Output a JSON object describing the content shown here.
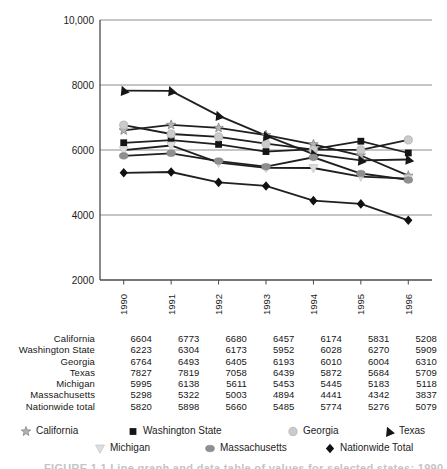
{
  "chart_data": {
    "type": "line",
    "categories": [
      "1990",
      "1991",
      "1992",
      "1993",
      "1994",
      "1995",
      "1996"
    ],
    "ylim": [
      2000,
      10000
    ],
    "yticks": [
      {
        "value": 10000,
        "label": "10,000"
      },
      {
        "value": 8000,
        "label": "8000"
      },
      {
        "value": 6000,
        "label": "6000"
      },
      {
        "value": 4000,
        "label": "4000"
      },
      {
        "value": 2000,
        "label": "2000"
      }
    ],
    "grid": true,
    "line_color": "#1f1f1f",
    "series": [
      {
        "name": "California",
        "marker": "star",
        "values": [
          6604,
          6773,
          6680,
          6457,
          6174,
          5831,
          5208
        ]
      },
      {
        "name": "Washington State",
        "marker": "square",
        "values": [
          6223,
          6304,
          6173,
          5952,
          6028,
          6270,
          5909
        ]
      },
      {
        "name": "Georgia",
        "marker": "circle",
        "values": [
          6764,
          6493,
          6405,
          6193,
          6010,
          6004,
          6310
        ]
      },
      {
        "name": "Texas",
        "marker": "triangle-up",
        "values": [
          7827,
          7819,
          7058,
          6439,
          5872,
          5684,
          5709
        ]
      },
      {
        "name": "Michigan",
        "marker": "triangle-down",
        "values": [
          5995,
          6138,
          5611,
          5453,
          5445,
          5183,
          5118
        ]
      },
      {
        "name": "Massachusetts",
        "marker": "diamond",
        "values": [
          5298,
          5322,
          5003,
          4894,
          4441,
          4342,
          3837
        ]
      },
      {
        "name": "Nationwide total",
        "marker": "oval",
        "values": [
          5820,
          5898,
          5660,
          5485,
          5774,
          5276,
          5079
        ]
      }
    ],
    "legend_position": "bottom"
  },
  "table": {
    "columns": [
      "1990",
      "1991",
      "1992",
      "1993",
      "1994",
      "1995",
      "1996"
    ],
    "rows": [
      {
        "label": "California",
        "values": [
          "6604",
          "6773",
          "6680",
          "6457",
          "6174",
          "5831",
          "5208"
        ]
      },
      {
        "label": "Washington State",
        "values": [
          "6223",
          "6304",
          "6173",
          "5952",
          "6028",
          "6270",
          "5909"
        ]
      },
      {
        "label": "Georgia",
        "values": [
          "6764",
          "6493",
          "6405",
          "6193",
          "6010",
          "6004",
          "6310"
        ]
      },
      {
        "label": "Texas",
        "values": [
          "7827",
          "7819",
          "7058",
          "6439",
          "5872",
          "5684",
          "5709"
        ]
      },
      {
        "label": "Michigan",
        "values": [
          "5995",
          "6138",
          "5611",
          "5453",
          "5445",
          "5183",
          "5118"
        ]
      },
      {
        "label": "Massachusetts",
        "values": [
          "5298",
          "5322",
          "5003",
          "4894",
          "4441",
          "4342",
          "3837"
        ]
      },
      {
        "label": "Nationwide total",
        "values": [
          "5820",
          "5898",
          "5660",
          "5485",
          "5774",
          "5276",
          "5079"
        ]
      }
    ]
  },
  "legend": {
    "entries": [
      {
        "label": "California",
        "marker": "star"
      },
      {
        "label": "Washington State",
        "marker": "square"
      },
      {
        "label": "Georgia",
        "marker": "circle"
      },
      {
        "label": "Texas",
        "marker": "triangle-up"
      },
      {
        "label": "Michigan",
        "marker": "triangle-down"
      },
      {
        "label": "Massachusetts",
        "marker": "oval"
      },
      {
        "label": "Nationwide Total",
        "marker": "diamond"
      }
    ]
  },
  "caption": {
    "text": "FIGURE 1.1 Line graph and data table of values for selected states: 1990 to 1996"
  },
  "marker_colors": {
    "star": {
      "fill": "#b3b3b3",
      "stroke": "#6f6f6f"
    },
    "square": {
      "fill": "#151515",
      "stroke": "none"
    },
    "circle": {
      "fill": "#cbcbcb",
      "stroke": "#b0b0b0"
    },
    "triangle-up": {
      "fill": "#161616",
      "stroke": "none"
    },
    "triangle-down": {
      "fill": "#dedede",
      "stroke": "#c3c3c3"
    },
    "oval": {
      "fill": "#8f8f8f",
      "stroke": "#7d7d7d"
    },
    "diamond": {
      "fill": "#111111",
      "stroke": "none"
    }
  },
  "axis_colors": {
    "grid": "#8c8c8c",
    "axis": "#4a4a4a",
    "text": "#1c1c1c"
  }
}
